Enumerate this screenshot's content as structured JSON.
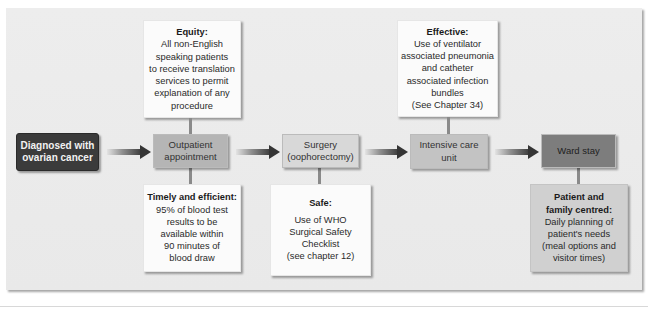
{
  "diagram": {
    "type": "patient-pathway-quality-dimensions",
    "stages": [
      {
        "id": "diagnosed",
        "label_lines": [
          "Diagnosed with",
          "ovarian cancer"
        ]
      },
      {
        "id": "outpatient",
        "label_lines": [
          "Outpatient",
          "appointment"
        ]
      },
      {
        "id": "surgery",
        "label_lines": [
          "Surgery",
          "(oophorectomy)"
        ]
      },
      {
        "id": "icu",
        "label_lines": [
          "Intensive care",
          "unit"
        ]
      },
      {
        "id": "ward",
        "label_lines": [
          "Ward stay"
        ]
      }
    ],
    "notes": [
      {
        "id": "equity",
        "attached_to": "outpatient",
        "position": "above",
        "title": "Equity:",
        "body_lines": [
          "All non-English",
          "speaking patients",
          "to receive translation",
          "services to permit",
          "explanation of any",
          "procedure"
        ]
      },
      {
        "id": "effective",
        "attached_to": "icu",
        "position": "above",
        "title": "Effective:",
        "body_lines": [
          "Use of ventilator",
          "associated pneumonia",
          "and catheter",
          "associated infection",
          "bundles",
          "(See Chapter 34)"
        ]
      },
      {
        "id": "timely",
        "attached_to": "outpatient",
        "position": "below",
        "title": "Timely and efficient:",
        "body_lines": [
          "95% of blood test",
          "results to be",
          "available within",
          "90 minutes of",
          "blood draw"
        ]
      },
      {
        "id": "safe",
        "attached_to": "surgery",
        "position": "below",
        "title": "Safe:",
        "body_lines": [
          "Use of WHO",
          "Surgical Safety",
          "Checklist",
          "(see chapter 12)"
        ]
      },
      {
        "id": "patient",
        "attached_to": "ward",
        "position": "below",
        "title_lines": [
          "Patient and",
          "family centred:"
        ],
        "body_lines": [
          "Daily planning of",
          "patient's needs",
          "(meal options and",
          "visitor times)"
        ]
      }
    ],
    "arrows": [
      {
        "from": "diagnosed",
        "to": "outpatient"
      },
      {
        "from": "outpatient",
        "to": "surgery"
      },
      {
        "from": "surgery",
        "to": "icu"
      },
      {
        "from": "icu",
        "to": "ward"
      }
    ],
    "colors": {
      "panel_bg": "#ebebeb",
      "start_box": "#3b3b3b",
      "outpatient_box": "#b5b5b5",
      "surgery_box": "#d8d8d8",
      "icu_box": "#c3c3c3",
      "ward_box": "#7d7d7d",
      "note_box": "#fbfbfb",
      "patient_note_box": "#d0d0d0",
      "arrow_dark": "#353535"
    }
  }
}
